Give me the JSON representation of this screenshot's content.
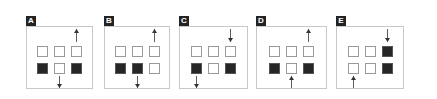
{
  "figure": {
    "colors": {
      "filled": "#262626",
      "empty": "#ffffff",
      "border": "#c8c8c8",
      "label_bg": "#232323",
      "arrow": "#333333"
    },
    "panels": [
      {
        "label": "A",
        "x": 26,
        "w": 67,
        "grid": [
          [
            0,
            0,
            0
          ],
          [
            1,
            0,
            1
          ]
        ],
        "arrows": [
          {
            "direction": "up",
            "col": 2,
            "position": "top",
            "meaning": "out"
          },
          {
            "direction": "down",
            "col": 1,
            "position": "bottom",
            "meaning": "out"
          }
        ]
      },
      {
        "label": "B",
        "x": 104,
        "w": 66,
        "grid": [
          [
            0,
            0,
            0
          ],
          [
            1,
            1,
            0
          ]
        ],
        "arrows": [
          {
            "direction": "up",
            "col": 2,
            "position": "top",
            "meaning": "out"
          },
          {
            "direction": "down",
            "col": 1,
            "position": "bottom",
            "meaning": "out"
          }
        ]
      },
      {
        "label": "C",
        "x": 179,
        "w": 69,
        "grid": [
          [
            0,
            0,
            0
          ],
          [
            1,
            0,
            1
          ]
        ],
        "arrows": [
          {
            "direction": "down",
            "col": 2,
            "position": "top",
            "meaning": "in"
          },
          {
            "direction": "down",
            "col": 0,
            "position": "bottom",
            "meaning": "out"
          }
        ]
      },
      {
        "label": "D",
        "x": 256,
        "w": 71,
        "grid": [
          [
            0,
            0,
            0
          ],
          [
            1,
            0,
            1
          ]
        ],
        "arrows": [
          {
            "direction": "up",
            "col": 2,
            "position": "top",
            "meaning": "out"
          },
          {
            "direction": "up",
            "col": 1,
            "position": "bottom",
            "meaning": "in"
          }
        ]
      },
      {
        "label": "E",
        "x": 336,
        "w": 68,
        "grid": [
          [
            0,
            0,
            1
          ],
          [
            0,
            0,
            1
          ]
        ],
        "arrows": [
          {
            "direction": "down",
            "col": 2,
            "position": "top",
            "meaning": "in"
          },
          {
            "direction": "up",
            "col": 0,
            "position": "bottom",
            "meaning": "in"
          }
        ]
      }
    ]
  }
}
